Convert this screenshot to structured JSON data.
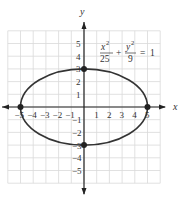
{
  "chart_data": {
    "type": "line",
    "title": "",
    "equation": {
      "x_numerator": "x",
      "x_denominator": "25",
      "y_numerator": "y",
      "y_denominator": "9",
      "rhs": "1",
      "exponent": "2"
    },
    "xlabel": "x",
    "ylabel": "y",
    "xlim": [
      -6,
      6
    ],
    "ylim": [
      -6,
      6
    ],
    "grid": true,
    "x_ticks": [
      "-5",
      "-4",
      "-3",
      "-2",
      "-1",
      "1",
      "2",
      "3",
      "4",
      "5"
    ],
    "y_ticks": [
      "5",
      "4",
      "3",
      "2",
      "1",
      "-1",
      "-2",
      "-3",
      "-4",
      "-5"
    ],
    "series": [
      {
        "name": "ellipse",
        "a": 5,
        "b": 3,
        "center": [
          0,
          0
        ]
      }
    ],
    "points": [
      {
        "x": -5,
        "y": 0
      },
      {
        "x": 5,
        "y": 0
      },
      {
        "x": 0,
        "y": 3
      },
      {
        "x": 0,
        "y": -3
      }
    ]
  },
  "colors": {
    "grid": "#d9d9d9",
    "axis": "#222222",
    "curve": "#333333",
    "text": "#333333"
  }
}
